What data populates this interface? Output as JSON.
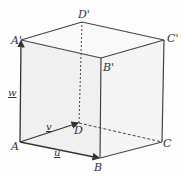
{
  "diagram": {
    "vertices": {
      "A": {
        "label": "A",
        "x": 20,
        "y": 142
      },
      "B": {
        "label": "B",
        "x": 100,
        "y": 158
      },
      "C": {
        "label": "C",
        "x": 162,
        "y": 142
      },
      "D": {
        "label": "D",
        "x": 79,
        "y": 123
      },
      "A1": {
        "label": "A'",
        "x": 21,
        "y": 40
      },
      "B1": {
        "label": "B'",
        "x": 101,
        "y": 58
      },
      "C1": {
        "label": "C'",
        "x": 164,
        "y": 40
      },
      "D1": {
        "label": "D'",
        "x": 82,
        "y": 22
      }
    },
    "vectors": {
      "u": {
        "label": "u",
        "from": "A",
        "to": "B"
      },
      "v": {
        "label": "v",
        "from": "A",
        "to": "D"
      },
      "w": {
        "label": "w",
        "from": "A",
        "to": "A'"
      }
    },
    "colors": {
      "edge": "#444444",
      "face": "#ececec",
      "background": "#fdfdfd"
    }
  }
}
